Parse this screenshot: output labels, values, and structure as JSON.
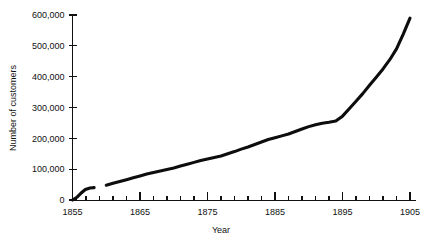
{
  "chart_data": {
    "type": "line",
    "title": "",
    "xlabel": "Year",
    "ylabel": "Number of customers",
    "xlim": [
      1855,
      1905
    ],
    "ylim": [
      0,
      600000
    ],
    "grid": false,
    "legend": false,
    "x_tick_labels": [
      "1855",
      "1865",
      "1875",
      "1885",
      "1895",
      "1905"
    ],
    "x_tick_values": [
      1855,
      1865,
      1875,
      1885,
      1895,
      1905
    ],
    "x_minor_tick_step": 2,
    "y_tick_labels": [
      "0",
      "100,000",
      "200,000",
      "300,000",
      "400,000",
      "500,000",
      "600,000"
    ],
    "y_tick_values": [
      0,
      100000,
      200000,
      300000,
      400000,
      500000,
      600000
    ],
    "line_color": "#0d0d0d",
    "background_color": "#ffffff",
    "series": [
      {
        "name": "Number of customers (early segment)",
        "x": [
          1855,
          1855.6,
          1856.2,
          1856.9,
          1857.6,
          1858.2
        ],
        "values": [
          0,
          8000,
          21000,
          34000,
          39000,
          40000
        ]
      },
      {
        "name": "Number of customers (main segment)",
        "x": [
          1860,
          1861,
          1862,
          1863,
          1864,
          1865,
          1866,
          1867,
          1868,
          1869,
          1870,
          1871,
          1872,
          1873,
          1874,
          1875,
          1876,
          1877,
          1878,
          1879,
          1880,
          1881,
          1882,
          1883,
          1884,
          1885,
          1886,
          1887,
          1888,
          1889,
          1890,
          1891,
          1892,
          1893,
          1894,
          1895,
          1896,
          1897,
          1898,
          1899,
          1900,
          1901,
          1902,
          1903,
          1904,
          1905
        ],
        "values": [
          48000,
          54000,
          60000,
          66000,
          72000,
          78000,
          84000,
          89000,
          94000,
          99000,
          104000,
          110000,
          116000,
          122000,
          128000,
          133000,
          138000,
          143000,
          150000,
          157000,
          165000,
          172000,
          180000,
          188000,
          196000,
          202000,
          208000,
          214000,
          222000,
          230000,
          238000,
          244000,
          249000,
          252000,
          256000,
          272000,
          296000,
          320000,
          345000,
          372000,
          398000,
          425000,
          455000,
          490000,
          538000,
          590000
        ]
      }
    ]
  },
  "axes": {
    "y_axis_title": "Number of customers",
    "x_axis_title": "Year"
  }
}
